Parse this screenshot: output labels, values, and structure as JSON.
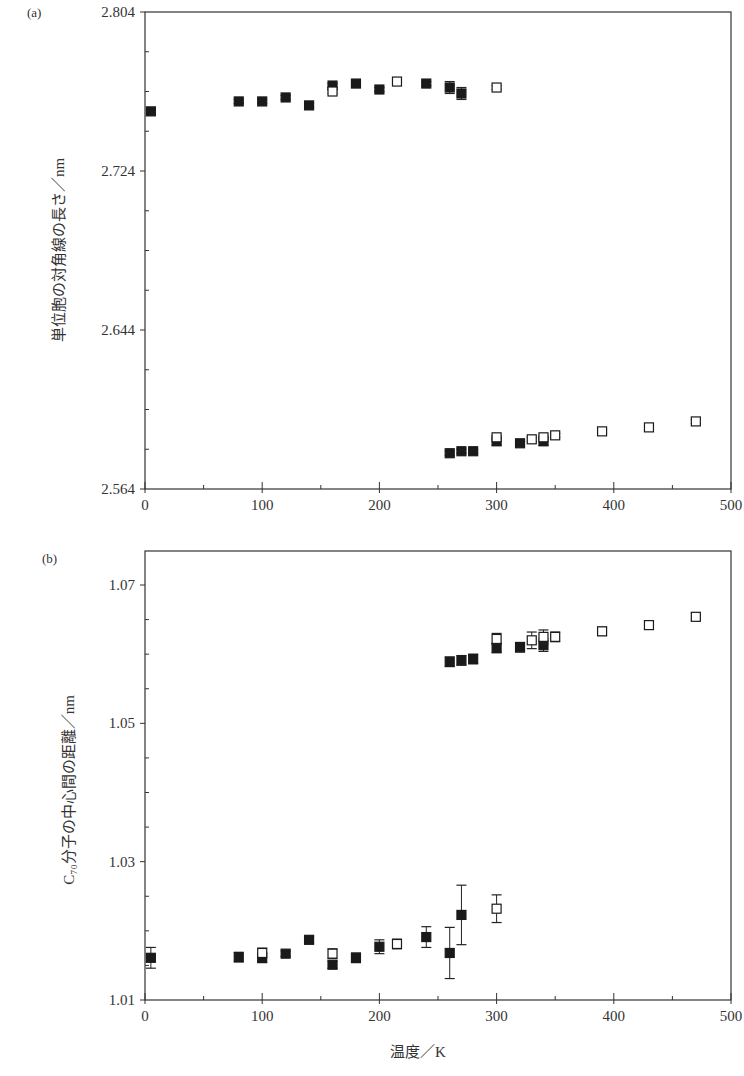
{
  "figure": {
    "xlabel": "温度／K"
  },
  "chart_data": [
    {
      "type": "scatter",
      "panel": "(a)",
      "title": "",
      "xlabel": "",
      "ylabel": "単位胞の対角線の長さ／nm",
      "xlim": [
        0,
        500
      ],
      "ylim": [
        2.564,
        2.804
      ],
      "xticks": [
        0,
        100,
        200,
        300,
        400,
        500
      ],
      "xtick_labels": [
        "0",
        "100",
        "200",
        "300",
        "400",
        "500"
      ],
      "yticks": [
        2.564,
        2.644,
        2.724,
        2.804
      ],
      "ytick_labels": [
        "2.564",
        "2.644",
        "2.724",
        "2.804"
      ],
      "grid": false,
      "legend": null,
      "series": [
        {
          "name": "filled squares",
          "marker": "filled-square",
          "points": [
            {
              "x": 5,
              "y": 2.754,
              "err": 0.001
            },
            {
              "x": 80,
              "y": 2.759,
              "err": 0.001
            },
            {
              "x": 100,
              "y": 2.759,
              "err": 0.001
            },
            {
              "x": 120,
              "y": 2.761,
              "err": 0.001
            },
            {
              "x": 140,
              "y": 2.757,
              "err": 0.001
            },
            {
              "x": 160,
              "y": 2.767,
              "err": 0.001
            },
            {
              "x": 180,
              "y": 2.768,
              "err": 0.001
            },
            {
              "x": 200,
              "y": 2.765,
              "err": 0.001
            },
            {
              "x": 240,
              "y": 2.768,
              "err": 0.001
            },
            {
              "x": 260,
              "y": 2.766,
              "err": 0.003
            },
            {
              "x": 270,
              "y": 2.763,
              "err": 0.003
            },
            {
              "x": 260,
              "y": 2.582,
              "err": 0.001
            },
            {
              "x": 270,
              "y": 2.583,
              "err": 0.001
            },
            {
              "x": 280,
              "y": 2.583,
              "err": 0.001
            },
            {
              "x": 300,
              "y": 2.588,
              "err": 0.002
            },
            {
              "x": 320,
              "y": 2.587,
              "err": 0.001
            },
            {
              "x": 340,
              "y": 2.588,
              "err": 0.002
            }
          ]
        },
        {
          "name": "open squares",
          "marker": "open-square",
          "points": [
            {
              "x": 160,
              "y": 2.764,
              "err": 0.001
            },
            {
              "x": 215,
              "y": 2.769,
              "err": 0.001
            },
            {
              "x": 300,
              "y": 2.766,
              "err": 0.001
            },
            {
              "x": 300,
              "y": 2.59,
              "err": 0.001
            },
            {
              "x": 330,
              "y": 2.589,
              "err": 0.001
            },
            {
              "x": 340,
              "y": 2.59,
              "err": 0.001
            },
            {
              "x": 350,
              "y": 2.591,
              "err": 0.001
            },
            {
              "x": 390,
              "y": 2.593,
              "err": 0.001
            },
            {
              "x": 430,
              "y": 2.595,
              "err": 0.001
            },
            {
              "x": 470,
              "y": 2.598,
              "err": 0.001
            }
          ]
        }
      ]
    },
    {
      "type": "scatter",
      "panel": "(b)",
      "title": "",
      "xlabel": "温度／K",
      "ylabel": "C₇₀分子の中心間の距離／nm",
      "xlim": [
        0,
        500
      ],
      "ylim": [
        1.01,
        1.075
      ],
      "xticks": [
        0,
        100,
        200,
        300,
        400,
        500
      ],
      "xtick_labels": [
        "0",
        "100",
        "200",
        "300",
        "400",
        "500"
      ],
      "yticks": [
        1.01,
        1.03,
        1.05,
        1.07
      ],
      "ytick_labels": [
        "1.01",
        "1.03",
        "1.05",
        "1.07"
      ],
      "grid": false,
      "legend": null,
      "series": [
        {
          "name": "filled squares",
          "marker": "filled-square",
          "points": [
            {
              "x": 5,
              "y": 1.0161,
              "err": 0.0015
            },
            {
              "x": 80,
              "y": 1.0162,
              "err": 0.0007
            },
            {
              "x": 100,
              "y": 1.0161,
              "err": 0.0007
            },
            {
              "x": 120,
              "y": 1.0167,
              "err": 0.0004
            },
            {
              "x": 140,
              "y": 1.0187,
              "err": 0.0005
            },
            {
              "x": 160,
              "y": 1.0151,
              "err": 0.0005
            },
            {
              "x": 180,
              "y": 1.0161,
              "err": 0.0007
            },
            {
              "x": 200,
              "y": 1.0177,
              "err": 0.001
            },
            {
              "x": 240,
              "y": 1.0191,
              "err": 0.0015
            },
            {
              "x": 260,
              "y": 1.0168,
              "err": 0.0037
            },
            {
              "x": 270,
              "y": 1.0223,
              "err": 0.0043
            },
            {
              "x": 260,
              "y": 1.0589,
              "err": 0.0007
            },
            {
              "x": 270,
              "y": 1.0591,
              "err": 0.0007
            },
            {
              "x": 280,
              "y": 1.0593,
              "err": 0.0007
            },
            {
              "x": 300,
              "y": 1.0609,
              "err": 0.0007
            },
            {
              "x": 320,
              "y": 1.061,
              "err": 0.0007
            },
            {
              "x": 340,
              "y": 1.0613,
              "err": 0.0009
            }
          ]
        },
        {
          "name": "open squares",
          "marker": "open-square",
          "points": [
            {
              "x": 100,
              "y": 1.0168,
              "err": 0.0007
            },
            {
              "x": 160,
              "y": 1.0167,
              "err": 0.0007
            },
            {
              "x": 215,
              "y": 1.0181,
              "err": 0.0007
            },
            {
              "x": 300,
              "y": 1.0232,
              "err": 0.002
            },
            {
              "x": 300,
              "y": 1.0622,
              "err": 0.0008
            },
            {
              "x": 330,
              "y": 1.062,
              "err": 0.0012
            },
            {
              "x": 340,
              "y": 1.0625,
              "err": 0.001
            },
            {
              "x": 350,
              "y": 1.0625,
              "err": 0.0007
            },
            {
              "x": 390,
              "y": 1.0633,
              "err": 0.0006
            },
            {
              "x": 430,
              "y": 1.0642,
              "err": 0.0005
            },
            {
              "x": 470,
              "y": 1.0654,
              "err": 0.0005
            }
          ]
        }
      ]
    }
  ]
}
